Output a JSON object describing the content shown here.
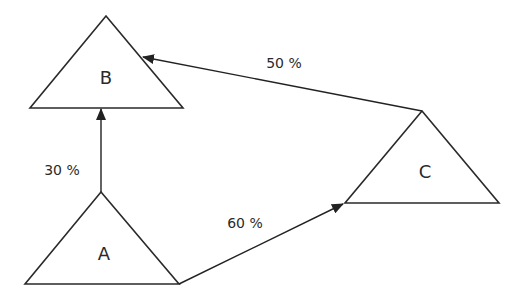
{
  "nodes": [
    {
      "id": "B",
      "label": "B"
    },
    {
      "id": "A",
      "label": "A"
    },
    {
      "id": "C",
      "label": "C"
    }
  ],
  "edges": [
    {
      "from": "A",
      "to": "B",
      "label": "30 %"
    },
    {
      "from": "C",
      "to": "B",
      "label": "50 %"
    },
    {
      "from": "A",
      "to": "C",
      "label": "60 %"
    }
  ],
  "colors": {
    "stroke": "#222222",
    "background": "#ffffff"
  }
}
